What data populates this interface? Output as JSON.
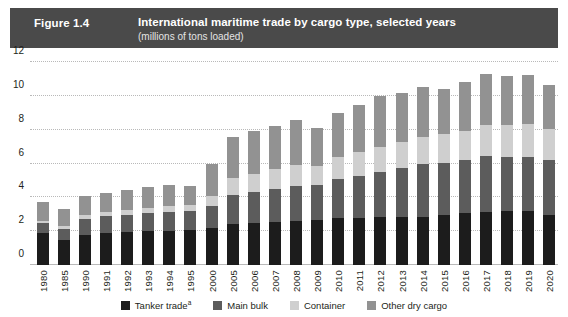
{
  "header": {
    "figure_number": "Figure 1.4",
    "title": "International maritime trade by cargo type, selected years",
    "subtitle": "(millions of tons loaded)",
    "bar_color": "#4a4a4a",
    "text_color": "#ffffff"
  },
  "legend": {
    "position": "bottom-center",
    "items": [
      {
        "label": "Tanker trade",
        "superscript": "a",
        "color": "#1c1c1c",
        "key": "tanker"
      },
      {
        "label": "Main bulk",
        "superscript": "",
        "color": "#5c5c5c",
        "key": "mainbulk"
      },
      {
        "label": "Container",
        "superscript": "",
        "color": "#cfcfcf",
        "key": "container"
      },
      {
        "label": "Other dry cargo",
        "superscript": "",
        "color": "#929292",
        "key": "otherdry"
      }
    ]
  },
  "chart_data": {
    "type": "bar",
    "stacked": true,
    "title": "International maritime trade by cargo type, selected years",
    "subtitle": "(millions of tons loaded)",
    "xlabel": "",
    "ylabel": "",
    "ylim": [
      0,
      12
    ],
    "yticks": [
      0,
      2,
      4,
      6,
      8,
      10,
      12
    ],
    "grid": true,
    "grid_style": "dotted-horizontal",
    "categories": [
      "1980",
      "1985",
      "1990",
      "1991",
      "1992",
      "1993",
      "1994",
      "1995",
      "2000",
      "2005",
      "2006",
      "2007",
      "2008",
      "2009",
      "2010",
      "2011",
      "2012",
      "2013",
      "2014",
      "2015",
      "2016",
      "2017",
      "2018",
      "2019",
      "2020"
    ],
    "series": [
      {
        "name": "Tanker trade",
        "color": "#1c1c1c",
        "values": [
          1.87,
          1.46,
          1.76,
          1.87,
          1.95,
          1.99,
          2.03,
          2.05,
          2.16,
          2.42,
          2.5,
          2.55,
          2.6,
          2.64,
          2.75,
          2.79,
          2.84,
          2.83,
          2.83,
          2.93,
          3.06,
          3.15,
          3.19,
          3.17,
          2.97
        ]
      },
      {
        "name": "Main bulk",
        "color": "#5c5c5c",
        "values": [
          0.61,
          0.68,
          0.99,
          1.0,
          1.03,
          1.08,
          1.11,
          1.13,
          1.3,
          1.71,
          1.82,
          1.96,
          2.07,
          2.09,
          2.34,
          2.48,
          2.67,
          2.92,
          3.12,
          3.13,
          3.17,
          3.27,
          3.21,
          3.23,
          3.24
        ]
      },
      {
        "name": "Container",
        "color": "#cfcfcf",
        "values": [
          0.1,
          0.15,
          0.23,
          0.25,
          0.28,
          0.31,
          0.35,
          0.37,
          0.6,
          1.0,
          1.08,
          1.19,
          1.25,
          1.13,
          1.28,
          1.39,
          1.46,
          1.52,
          1.63,
          1.66,
          1.72,
          1.83,
          1.88,
          1.91,
          1.85
        ]
      },
      {
        "name": "Other dry cargo",
        "color": "#929292",
        "values": [
          1.12,
          1.03,
          1.11,
          1.15,
          1.19,
          1.21,
          1.26,
          1.13,
          1.93,
          2.42,
          2.51,
          2.54,
          2.63,
          2.27,
          2.62,
          2.81,
          3.01,
          2.89,
          2.95,
          2.7,
          2.89,
          3.02,
          2.87,
          2.92,
          2.61
        ]
      }
    ],
    "totals": [
      3.7,
      3.32,
      4.09,
      4.27,
      4.45,
      4.59,
      4.75,
      4.68,
      5.99,
      7.55,
      7.91,
      8.24,
      8.55,
      8.13,
      8.99,
      9.47,
      9.98,
      10.16,
      10.53,
      10.42,
      10.84,
      11.27,
      11.15,
      11.23,
      10.67
    ]
  }
}
